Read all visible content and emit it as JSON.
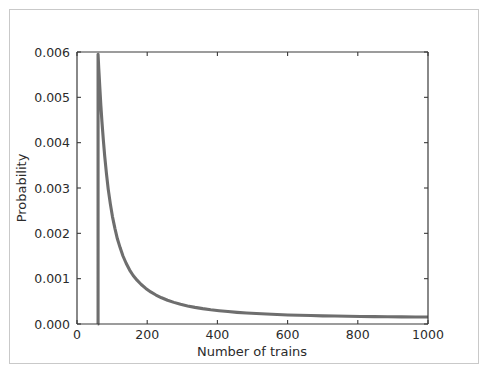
{
  "figure": {
    "background_color": "#ffffff",
    "border_color": "#c9c9c9"
  },
  "chart_data": {
    "type": "line",
    "title": "",
    "subtitle": "",
    "xlabel": "Number of trains",
    "ylabel": "Probability",
    "xlim": [
      0,
      1000
    ],
    "ylim": [
      0.0,
      0.006
    ],
    "xticks": [
      0,
      200,
      400,
      600,
      800,
      1000
    ],
    "xticklabels": [
      "0",
      "200",
      "400",
      "600",
      "800",
      "1000"
    ],
    "yticks": [
      0.0,
      0.001,
      0.002,
      0.003,
      0.004,
      0.005,
      0.006
    ],
    "yticklabels": [
      "0.000",
      "0.001",
      "0.002",
      "0.003",
      "0.004",
      "0.005",
      "0.006"
    ],
    "grid": false,
    "legend": null,
    "legend_position": "none",
    "annotations": [],
    "series": [
      {
        "name": "posterior",
        "color": "#6e6e6e",
        "linewidth": 3.1,
        "x": [
          59,
          60,
          60,
          62,
          65,
          68,
          71,
          75,
          79,
          84,
          89,
          95,
          101,
          108,
          115,
          123,
          131,
          140,
          150,
          160,
          171,
          183,
          196,
          210,
          225,
          241,
          258,
          276,
          295,
          315,
          336,
          358,
          381,
          405,
          430,
          456,
          483,
          511,
          540,
          570,
          601,
          633,
          666,
          700,
          735,
          771,
          808,
          846,
          885,
          925,
          965,
          1000
        ],
        "y": [
          0.0,
          0.0,
          0.00595,
          0.00564,
          0.00522,
          0.00482,
          0.00447,
          0.00406,
          0.0037,
          0.00331,
          0.00297,
          0.00265,
          0.00237,
          0.00211,
          0.00188,
          0.00168,
          0.0015,
          0.00134,
          0.00119,
          0.00107,
          0.000967,
          0.000872,
          0.000785,
          0.000707,
          0.000639,
          0.000578,
          0.000524,
          0.000477,
          0.000436,
          0.000399,
          0.000367,
          0.000339,
          0.000314,
          0.000293,
          0.000274,
          0.000257,
          0.000243,
          0.00023,
          0.000219,
          0.000209,
          0.0002,
          0.000193,
          0.000186,
          0.00018,
          0.000175,
          0.000171,
          0.000167,
          0.000163,
          0.00016,
          0.000157,
          0.000155,
          0.000153
        ]
      }
    ]
  }
}
